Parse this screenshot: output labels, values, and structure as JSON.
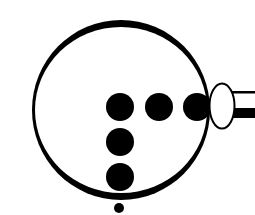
{
  "diagram": {
    "colors": {
      "ink": "#000000",
      "background": "#ffffff"
    },
    "outer_circle": {
      "cx": 121,
      "cy": 110,
      "r": 88
    },
    "dots": [
      {
        "cx": 120,
        "cy": 107,
        "r": 14
      },
      {
        "cx": 159,
        "cy": 107,
        "r": 14
      },
      {
        "cx": 197,
        "cy": 107,
        "r": 14
      },
      {
        "cx": 120,
        "cy": 142,
        "r": 14
      },
      {
        "cx": 120,
        "cy": 177,
        "r": 14
      }
    ],
    "small_dot": {
      "cx": 119,
      "cy": 208,
      "r": 5
    },
    "oval": {
      "cx": 222,
      "cy": 106,
      "rx": 13,
      "ry": 23
    },
    "tube": {
      "x": 235,
      "top_line_y": 92,
      "band_y": 108,
      "band_h": 10
    }
  }
}
